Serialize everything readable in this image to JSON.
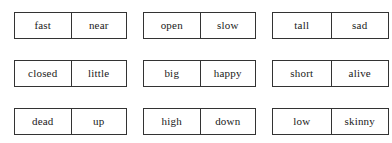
{
  "worksheet": {
    "type": "word-pair-grid",
    "columns": 3,
    "rows": 3,
    "border_color": "#333333",
    "background_color": "#ffffff",
    "text_color": "#1a1a1a",
    "pairs": [
      {
        "left": "fast",
        "right": "near"
      },
      {
        "left": "open",
        "right": "slow"
      },
      {
        "left": "tall",
        "right": "sad"
      },
      {
        "left": "closed",
        "right": "little"
      },
      {
        "left": "big",
        "right": "happy"
      },
      {
        "left": "short",
        "right": "alive"
      },
      {
        "left": "dead",
        "right": "up"
      },
      {
        "left": "high",
        "right": "down"
      },
      {
        "left": "low",
        "right": "skinny"
      }
    ]
  }
}
